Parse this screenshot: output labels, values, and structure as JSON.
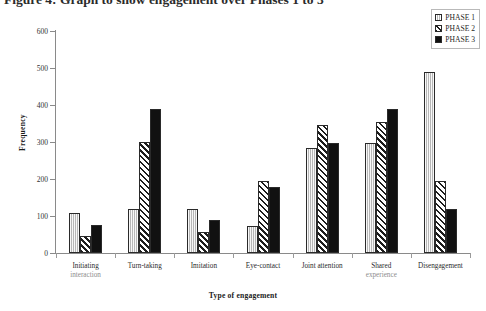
{
  "figure": {
    "clipped_title": "Figure 4: Graph to show engagement over Phases 1 to 3"
  },
  "legend": {
    "position": "top-right",
    "entries": [
      {
        "label": "PHASE 1",
        "icon": "legend-swatch-light-vertical-hatch",
        "color": "#e4e4e4"
      },
      {
        "label": "PHASE 2",
        "icon": "legend-swatch-diagonal-hatch",
        "color": "#ffffff"
      },
      {
        "label": "PHASE 3",
        "icon": "legend-swatch-solid-black",
        "color": "#111111"
      }
    ]
  },
  "axes": {
    "y_title": "Frequency",
    "x_title": "Type of engagement",
    "y_ticks": [
      "600",
      "500",
      "400",
      "300",
      "200",
      "100",
      "0"
    ]
  },
  "chart_data": {
    "type": "bar",
    "title": "Graph to show engagement over Phases 1 to 3",
    "xlabel": "Type of engagement",
    "ylabel": "Frequency",
    "ylim": [
      0,
      600
    ],
    "ytick_interval": 100,
    "grid": false,
    "legend_position": "top-right",
    "categories": [
      "Initiating interaction",
      "Turn-taking",
      "Imitation",
      "Eye-contact",
      "Joint attention",
      "Shared experience",
      "Disengagement"
    ],
    "category_lines": [
      [
        "Initiating",
        "interaction"
      ],
      [
        "Turn-taking",
        ""
      ],
      [
        "Imitation",
        ""
      ],
      [
        "Eye-contact",
        ""
      ],
      [
        "Joint attention",
        ""
      ],
      [
        "Shared",
        "experience"
      ],
      [
        "Disengagement",
        ""
      ]
    ],
    "series": [
      {
        "name": "PHASE 1",
        "values": [
          107,
          118,
          120,
          72,
          283,
          297,
          490
        ]
      },
      {
        "name": "PHASE 2",
        "values": [
          45,
          300,
          58,
          195,
          345,
          355,
          195
        ]
      },
      {
        "name": "PHASE 3",
        "values": [
          75,
          390,
          90,
          178,
          297,
          388,
          118
        ]
      }
    ]
  }
}
